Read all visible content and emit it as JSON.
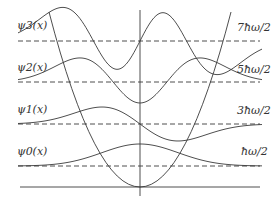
{
  "colors": {
    "line": "#3a3a3a",
    "text": "#333333",
    "background": "#ffffff"
  },
  "levels": [
    {
      "n": 0,
      "wavefunction_label": "ψ0(x)",
      "energy_label": "ħω/2"
    },
    {
      "n": 1,
      "wavefunction_label": "ψ1(x)",
      "energy_label": "3ħω/2"
    },
    {
      "n": 2,
      "wavefunction_label": "ψ2(x)",
      "energy_label": "5ħω/2"
    },
    {
      "n": 3,
      "wavefunction_label": "ψ3(x)",
      "energy_label": "7ħω/2"
    }
  ]
}
